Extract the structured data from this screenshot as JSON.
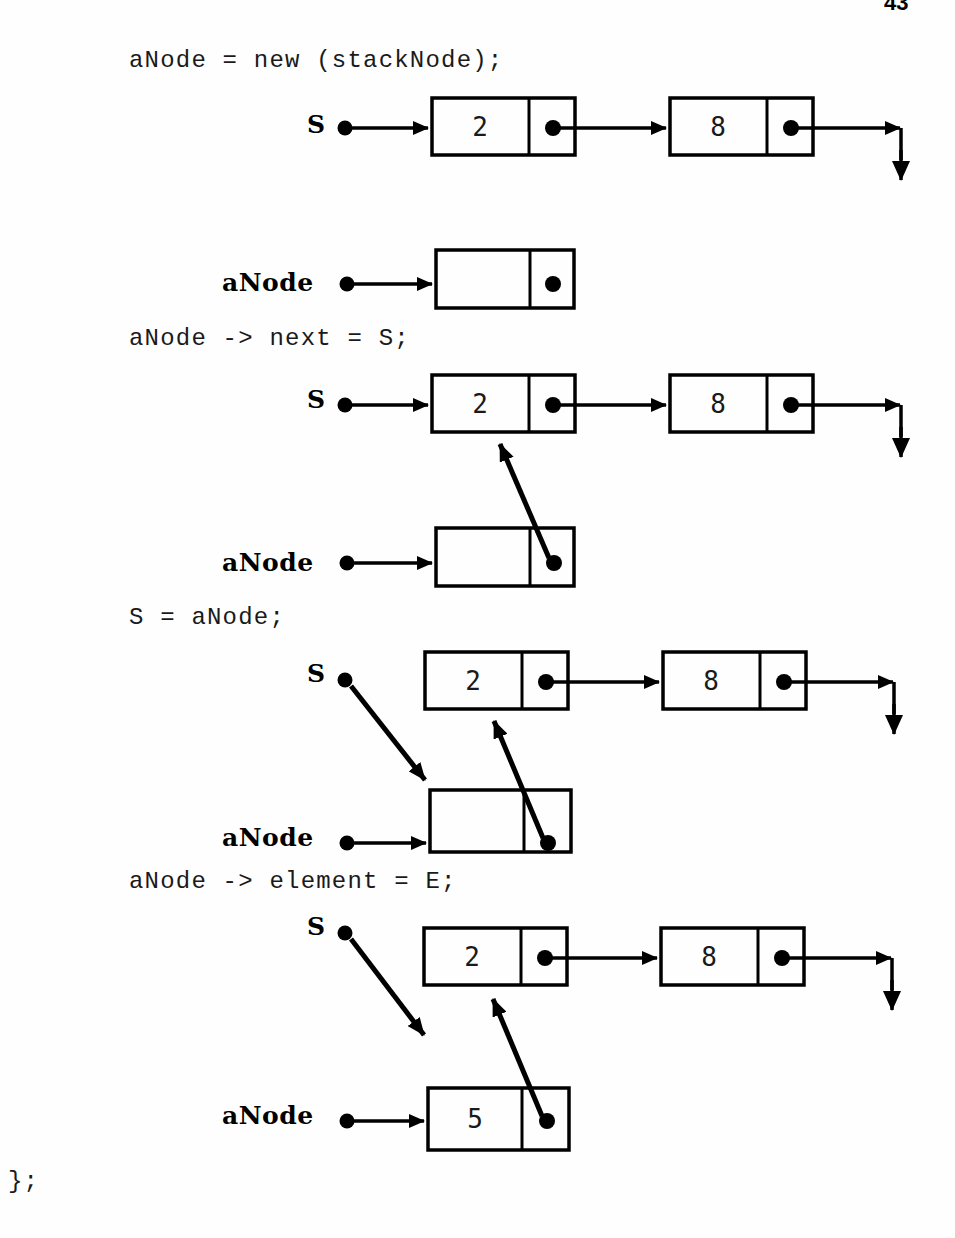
{
  "page": {
    "number": "43",
    "background": "#ffffff",
    "ink": "#000000"
  },
  "code": {
    "line1": "aNode = new (stackNode);",
    "line2": "aNode -> next = S;",
    "line3": "S = aNode;",
    "line4": "aNode -> element = E;",
    "line5": "};"
  },
  "labels": {
    "stack_pointer": "S",
    "anode_pointer": "aNode"
  },
  "steps": [
    {
      "id": "step-1",
      "code": "aNode = new (stackNode);",
      "list": {
        "nodes": [
          {
            "value": "2",
            "has_next_pointer": true
          },
          {
            "value": "8",
            "has_next_pointer": true
          }
        ],
        "tail_arrow": "down"
      },
      "head_label": "S",
      "new_node": {
        "label": "aNode",
        "value": "",
        "has_next_pointer": true,
        "next_target": "none"
      }
    },
    {
      "id": "step-2",
      "code": "aNode -> next = S;",
      "list": {
        "nodes": [
          {
            "value": "2",
            "has_next_pointer": true
          },
          {
            "value": "8",
            "has_next_pointer": true
          }
        ],
        "tail_arrow": "down"
      },
      "head_label": "S",
      "new_node": {
        "label": "aNode",
        "value": "",
        "has_next_pointer": true,
        "next_target": "node-2"
      }
    },
    {
      "id": "step-3",
      "code": "S = aNode;",
      "list": {
        "nodes": [
          {
            "value": "2",
            "has_next_pointer": true
          },
          {
            "value": "8",
            "has_next_pointer": true
          }
        ],
        "tail_arrow": "down"
      },
      "head_label": "S",
      "head_target": "anode-box",
      "new_node": {
        "label": "aNode",
        "value": "",
        "has_next_pointer": true,
        "next_target": "node-2"
      }
    },
    {
      "id": "step-4",
      "code": "aNode -> element = E;",
      "list": {
        "nodes": [
          {
            "value": "2",
            "has_next_pointer": true
          },
          {
            "value": "8",
            "has_next_pointer": true
          }
        ],
        "tail_arrow": "down"
      },
      "head_label": "S",
      "head_target": "anode-box",
      "new_node": {
        "label": "aNode",
        "value": "5",
        "has_next_pointer": true,
        "next_target": "node-2"
      }
    }
  ],
  "node_values": {
    "n1_row1": "2",
    "n2_row1": "8",
    "n1_row2": "2",
    "n2_row2": "8",
    "anode_row2": "",
    "n1_row3": "2",
    "n2_row3": "8",
    "anode_row3": "",
    "n1_row4": "2",
    "n2_row4": "8",
    "anode_row4": "5",
    "anode_row0": ""
  }
}
